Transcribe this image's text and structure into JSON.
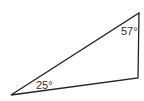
{
  "diagram": {
    "type": "triangle",
    "vertices": {
      "top_right": [
        139,
        13
      ],
      "bottom_right": [
        138,
        78
      ],
      "bottom_left": [
        11,
        95
      ]
    },
    "stroke_color": "#222222",
    "angles": [
      {
        "label": "57°",
        "vertex": "top_right"
      },
      {
        "label": "25°",
        "vertex": "bottom_left"
      }
    ]
  }
}
